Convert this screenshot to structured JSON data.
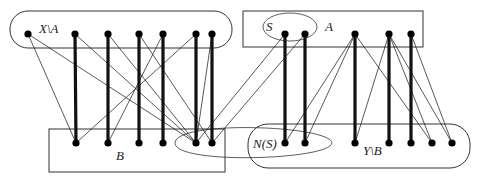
{
  "diagram": {
    "type": "bipartite-graph",
    "labels": {
      "x_minus_a": "X\\A",
      "a": "A",
      "s": "S",
      "b": "B",
      "n_s": "N(S)",
      "y_minus_b": "Y\\B"
    },
    "top_y": 34,
    "bottom_y": 143,
    "top_nodes": [
      {
        "id": "t1",
        "x": 28,
        "group": "X\\A"
      },
      {
        "id": "t2",
        "x": 75,
        "group": "X\\A"
      },
      {
        "id": "t3",
        "x": 108,
        "group": "X\\A"
      },
      {
        "id": "t4",
        "x": 139,
        "group": "X\\A"
      },
      {
        "id": "t5",
        "x": 163,
        "group": "X\\A"
      },
      {
        "id": "t6",
        "x": 196,
        "group": "X\\A"
      },
      {
        "id": "t7",
        "x": 212,
        "group": "X\\A"
      },
      {
        "id": "t8",
        "x": 285,
        "group": "S"
      },
      {
        "id": "t9",
        "x": 305,
        "group": "S"
      },
      {
        "id": "t10",
        "x": 355,
        "group": "A"
      },
      {
        "id": "t11",
        "x": 389,
        "group": "A"
      },
      {
        "id": "t12",
        "x": 411,
        "group": "A"
      }
    ],
    "bottom_nodes": [
      {
        "id": "b1",
        "x": 76,
        "group": "B"
      },
      {
        "id": "b2",
        "x": 108,
        "group": "B"
      },
      {
        "id": "b3",
        "x": 139,
        "group": "B"
      },
      {
        "id": "b4",
        "x": 163,
        "group": "B"
      },
      {
        "id": "b5",
        "x": 196,
        "group": "B"
      },
      {
        "id": "b6",
        "x": 212,
        "group": "B"
      },
      {
        "id": "b7",
        "x": 285,
        "group": "N(S)"
      },
      {
        "id": "b8",
        "x": 305,
        "group": "N(S)"
      },
      {
        "id": "b9",
        "x": 355,
        "group": "Y\\B"
      },
      {
        "id": "b10",
        "x": 389,
        "group": "Y\\B"
      },
      {
        "id": "b11",
        "x": 411,
        "group": "Y\\B"
      },
      {
        "id": "b12",
        "x": 432,
        "group": "Y\\B"
      },
      {
        "id": "b13",
        "x": 452,
        "group": "Y\\B"
      }
    ],
    "matching_edges": [
      [
        "t2",
        "b1"
      ],
      [
        "t3",
        "b2"
      ],
      [
        "t4",
        "b3"
      ],
      [
        "t5",
        "b4"
      ],
      [
        "t6",
        "b5"
      ],
      [
        "t7",
        "b6"
      ],
      [
        "t8",
        "b7"
      ],
      [
        "t9",
        "b8"
      ],
      [
        "t10",
        "b9"
      ],
      [
        "t11",
        "b10"
      ],
      [
        "t12",
        "b11"
      ]
    ],
    "other_edges": [
      [
        "t1",
        "b1"
      ],
      [
        "t1",
        "b5"
      ],
      [
        "t2",
        "b5"
      ],
      [
        "t3",
        "b5"
      ],
      [
        "t4",
        "b6"
      ],
      [
        "t5",
        "b2"
      ],
      [
        "t6",
        "b1"
      ],
      [
        "t7",
        "b5"
      ],
      [
        "t8",
        "b5"
      ],
      [
        "t9",
        "b6"
      ],
      [
        "t10",
        "b7"
      ],
      [
        "t10",
        "b8"
      ],
      [
        "t11",
        "b9"
      ],
      [
        "t11",
        "b12"
      ],
      [
        "t11",
        "b13"
      ],
      [
        "t12",
        "b13"
      ],
      [
        "t10",
        "b12"
      ]
    ]
  }
}
